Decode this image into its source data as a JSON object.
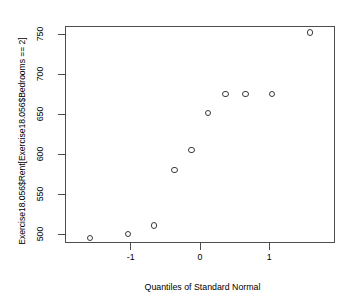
{
  "chart_data": {
    "type": "scatter",
    "title": "",
    "xlabel": "Quantiles of Standard Normal",
    "ylabel": "Exercise18.056$Rent[Exercise18.056$Bedrooms == 2]",
    "xlim": [
      -1.95,
      1.95
    ],
    "ylim": [
      489,
      760
    ],
    "grid": false,
    "legend": null,
    "marker": "open-circle",
    "x_ticks": [
      -1,
      0,
      1
    ],
    "x_tick_labels": [
      "-1",
      "0",
      "1"
    ],
    "y_ticks": [
      500,
      550,
      600,
      650,
      700,
      750
    ],
    "y_tick_labels": [
      "500",
      "550",
      "600",
      "650",
      "700",
      "750"
    ],
    "series": [
      {
        "name": "Rent (2 bedrooms)",
        "points": [
          {
            "x": -1.59,
            "y": 495
          },
          {
            "x": -1.04,
            "y": 500
          },
          {
            "x": -0.66,
            "y": 511
          },
          {
            "x": -0.37,
            "y": 580
          },
          {
            "x": -0.12,
            "y": 605
          },
          {
            "x": 0.12,
            "y": 651
          },
          {
            "x": 0.37,
            "y": 675
          },
          {
            "x": 0.66,
            "y": 675
          },
          {
            "x": 1.04,
            "y": 675
          },
          {
            "x": 1.59,
            "y": 752
          }
        ]
      }
    ],
    "colors": {
      "point_stroke": "#3a3a3a",
      "axis": "#4d4d4d",
      "text": "#000000",
      "background": "#ffffff"
    }
  }
}
